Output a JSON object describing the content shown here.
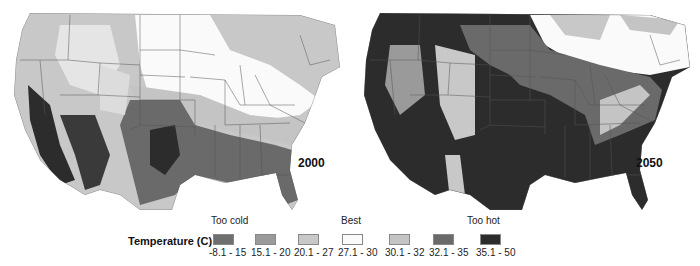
{
  "maps": [
    {
      "year_label": "2000"
    },
    {
      "year_label": "2050"
    }
  ],
  "legend": {
    "title": "Temperature (C)",
    "categories": {
      "too_cold": "Too cold",
      "best": "Best",
      "too_hot": "Too hot"
    },
    "bins": [
      {
        "range": "-8.1 - 15",
        "color": "#6e6e6e"
      },
      {
        "range": "15.1 - 20",
        "color": "#9a9a9a"
      },
      {
        "range": "20.1 - 27",
        "color": "#c8c8c8"
      },
      {
        "range": "27.1 - 30",
        "color": "#fafafa"
      },
      {
        "range": "30.1 - 32",
        "color": "#c4c4c4"
      },
      {
        "range": "32.1 - 35",
        "color": "#6a6a6a"
      },
      {
        "range": "35.1 - 50",
        "color": "#2c2c2c"
      }
    ]
  },
  "colors": {
    "background": "#ffffff",
    "state_border": "#555555",
    "cold_light": "#c8c8c8",
    "best": "#fafafa",
    "warm_light": "#c4c4c4",
    "hot": "#6a6a6a",
    "very_hot": "#2c2c2c"
  }
}
